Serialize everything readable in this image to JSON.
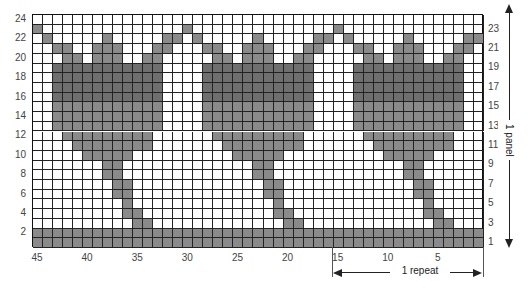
{
  "chart": {
    "columns": 45,
    "rows": 24,
    "repeat_width": 15,
    "colors": {
      "shaded": "#8a8a8a",
      "shaded_dark": "#6f6f6f",
      "grid": "#222222",
      "background": "#ffffff"
    },
    "repeat_shaded_offsets_by_row": {
      "24": [],
      "23": [
        0
      ],
      "22": [
        1,
        7,
        13,
        14
      ],
      "21": [
        2,
        3,
        6,
        7,
        8,
        12,
        13
      ],
      "20": [
        3,
        4,
        6,
        7,
        8,
        11,
        12
      ],
      "19": [
        2,
        3,
        4,
        5,
        6,
        7,
        8,
        9,
        10,
        11,
        12
      ],
      "18": [
        2,
        3,
        4,
        5,
        6,
        7,
        8,
        9,
        10,
        11,
        12
      ],
      "17": [
        2,
        3,
        4,
        5,
        6,
        7,
        8,
        9,
        10,
        11,
        12
      ],
      "16": [
        2,
        3,
        4,
        5,
        6,
        7,
        8,
        9,
        10,
        11,
        12
      ],
      "15": [
        2,
        3,
        4,
        5,
        6,
        7,
        8,
        9,
        10,
        11,
        12
      ],
      "14": [
        2,
        3,
        4,
        5,
        6,
        7,
        8,
        9,
        10,
        11,
        12
      ],
      "13": [
        2,
        3,
        4,
        5,
        6,
        7,
        8,
        9,
        10,
        11,
        12
      ],
      "12": [
        3,
        4,
        5,
        6,
        7,
        8,
        9,
        10,
        11
      ],
      "11": [
        4,
        5,
        6,
        7,
        8,
        9,
        10,
        11
      ],
      "10": [
        5,
        6,
        7,
        8,
        9
      ],
      "9": [
        7,
        8
      ],
      "8": [
        7,
        8
      ],
      "7": [
        8,
        9
      ],
      "6": [
        8,
        9
      ],
      "5": [
        9
      ],
      "4": [
        9,
        10
      ],
      "3": [
        10,
        11
      ],
      "2": [
        0,
        1,
        2,
        3,
        4,
        5,
        6,
        7,
        8,
        9,
        10,
        11,
        12,
        13,
        14
      ],
      "1": [
        0,
        1,
        2,
        3,
        4,
        5,
        6,
        7,
        8,
        9,
        10,
        11,
        12,
        13,
        14
      ]
    },
    "dark_rows": [
      "19",
      "18",
      "17",
      "16"
    ]
  },
  "axes": {
    "left_row_labels": [
      "24",
      "22",
      "20",
      "18",
      "16",
      "14",
      "12",
      "10",
      "8",
      "6",
      "4",
      "2"
    ],
    "right_row_labels": [
      "23",
      "21",
      "19",
      "17",
      "15",
      "13",
      "11",
      "9",
      "7",
      "5",
      "3",
      "1"
    ],
    "bottom_stitch_labels": [
      {
        "label": "45",
        "stitch": 45
      },
      {
        "label": "40",
        "stitch": 40
      },
      {
        "label": "35",
        "stitch": 35
      },
      {
        "label": "30",
        "stitch": 30
      },
      {
        "label": "25",
        "stitch": 25
      },
      {
        "label": "20",
        "stitch": 20
      },
      {
        "label": "15",
        "stitch": 15
      },
      {
        "label": "10",
        "stitch": 10
      },
      {
        "label": "5",
        "stitch": 5
      }
    ]
  },
  "annotations": {
    "panel_label": "1 panel",
    "repeat_label": "1 repeat"
  }
}
